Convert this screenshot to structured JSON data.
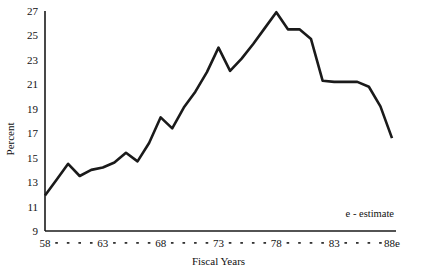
{
  "chart_data": {
    "type": "line",
    "title": "",
    "xlabel": "Fiscal Years",
    "ylabel": "Percent",
    "ylim": [
      9,
      27
    ],
    "xlim": [
      58,
      88
    ],
    "grid": false,
    "legend": "none",
    "annotation": "e - estimate",
    "y_ticks": [
      9,
      11,
      13,
      15,
      17,
      19,
      21,
      23,
      25,
      27
    ],
    "y_tick_labels": [
      "9",
      "11",
      "13",
      "15",
      "17",
      "19",
      "21",
      "23",
      "25",
      "27"
    ],
    "x_ticks": [
      58,
      63,
      68,
      73,
      78,
      83,
      88
    ],
    "x_tick_labels": [
      "58",
      "63",
      "68",
      "73",
      "78",
      "83",
      "88e"
    ],
    "x_minor_ticks_between_labels": 4,
    "x": [
      58,
      59,
      60,
      61,
      62,
      63,
      64,
      65,
      66,
      67,
      68,
      69,
      70,
      71,
      72,
      73,
      74,
      75,
      76,
      77,
      78,
      79,
      80,
      81,
      82,
      83,
      84,
      85,
      86,
      87,
      88
    ],
    "values": [
      11.9,
      13.2,
      14.5,
      13.5,
      14.0,
      14.2,
      14.6,
      15.4,
      14.7,
      16.2,
      18.3,
      17.4,
      19.1,
      20.4,
      22.0,
      24.0,
      22.1,
      23.1,
      24.3,
      25.6,
      26.9,
      25.5,
      25.5,
      24.7,
      21.3,
      21.2,
      21.2,
      21.2,
      20.8,
      19.2,
      16.6
    ],
    "series": [
      {
        "name": "Percent",
        "values": [
          11.9,
          13.2,
          14.5,
          13.5,
          14.0,
          14.2,
          14.6,
          15.4,
          14.7,
          16.2,
          18.3,
          17.4,
          19.1,
          20.4,
          22.0,
          24.0,
          22.1,
          23.1,
          24.3,
          25.6,
          26.9,
          25.5,
          25.5,
          24.7,
          21.3,
          21.2,
          21.2,
          21.2,
          20.8,
          19.2,
          16.6
        ],
        "color": "#1a1a1a"
      }
    ]
  },
  "colors": {
    "line": "#1a1a1a",
    "axis": "#1a1a1a",
    "background": "#ffffff",
    "text": "#111111"
  }
}
